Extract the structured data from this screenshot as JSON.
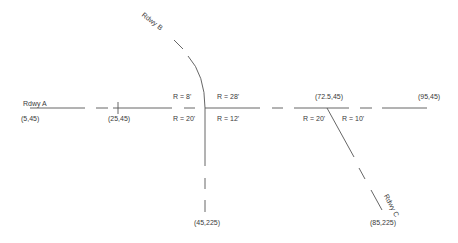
{
  "diagram": {
    "title": "",
    "roadways": [
      {
        "id": "A",
        "label": "Rdwy A"
      },
      {
        "id": "B",
        "label": "Rdwy B"
      },
      {
        "id": "C",
        "label": "Rdwy C"
      }
    ],
    "coordinates": {
      "a_start": "(5,45)",
      "a_tick": "(25,45)",
      "intersection_c": "(72.5,45)",
      "a_end": "(95,45)",
      "b_end": "(45,225)",
      "c_end": "(85,225)"
    },
    "radii": {
      "b_nw": "R = 8'",
      "b_ne": "R = 28'",
      "b_sw": "R = 20'",
      "b_se": "R = 12'",
      "c_left": "R = 20'",
      "c_right": "R = 10'"
    },
    "colors": {
      "line": "#555555",
      "text": "#3a3a3a",
      "background": "#ffffff"
    }
  }
}
